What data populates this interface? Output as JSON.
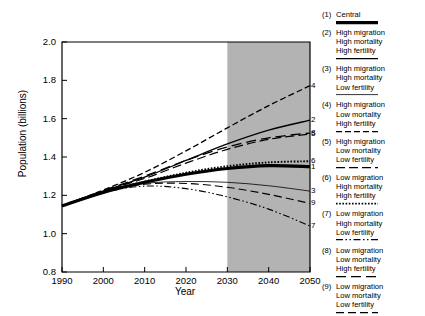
{
  "chart_data": {
    "type": "line",
    "title": "",
    "xlabel": "Year",
    "ylabel": "Population (billions)",
    "xlim": [
      1990,
      2050
    ],
    "ylim": [
      0.8,
      2.0
    ],
    "xticks": [
      1990,
      2000,
      2010,
      2020,
      2030,
      2040,
      2050
    ],
    "yticks": [
      "0.8",
      "1.0",
      "1.2",
      "1.4",
      "1.6",
      "1.8",
      "2.0"
    ],
    "grid": false,
    "legend_position": "right",
    "shaded_region": {
      "from": 2030,
      "to": 2050,
      "color": "#b3b3b3"
    },
    "x": [
      1990,
      2000,
      2010,
      2020,
      2030,
      2040,
      2050
    ],
    "series": [
      {
        "id": "1",
        "name": "Central",
        "style": "thick-solid",
        "end_label": "1",
        "values": [
          1.145,
          1.215,
          1.268,
          1.31,
          1.34,
          1.355,
          1.35
        ]
      },
      {
        "id": "2",
        "name": "High migration High mortality High fertility",
        "style": "solid",
        "end_label": "2",
        "values": [
          1.145,
          1.222,
          1.295,
          1.382,
          1.468,
          1.54,
          1.592
        ]
      },
      {
        "id": "3",
        "name": "High migration High mortality Low fertility",
        "style": "solid-thin",
        "end_label": "3",
        "values": [
          1.145,
          1.22,
          1.262,
          1.272,
          1.268,
          1.25,
          1.222
        ]
      },
      {
        "id": "4",
        "name": "High migration Low mortality High fertility",
        "style": "dashed",
        "end_label": "4",
        "values": [
          1.145,
          1.228,
          1.32,
          1.432,
          1.552,
          1.668,
          1.772
        ]
      },
      {
        "id": "5",
        "name": "High migration Low mortality Low fertility",
        "style": "long-dash",
        "end_label": "5",
        "values": [
          1.145,
          1.222,
          1.288,
          1.368,
          1.44,
          1.492,
          1.52
        ]
      },
      {
        "id": "6",
        "name": "Low migration High mortality High fertility",
        "style": "dotted",
        "end_label": "6",
        "values": [
          1.145,
          1.218,
          1.272,
          1.318,
          1.352,
          1.372,
          1.378
        ]
      },
      {
        "id": "7",
        "name": "Low migration High mortality Low fertility",
        "style": "dash-dot-dot",
        "end_label": "7",
        "values": [
          1.145,
          1.215,
          1.248,
          1.235,
          1.192,
          1.128,
          1.04
        ]
      },
      {
        "id": "8",
        "name": "Low migration Low mortality High fertility",
        "style": "long-dash-wide",
        "end_label": "8",
        "values": [
          1.145,
          1.225,
          1.3,
          1.382,
          1.452,
          1.5,
          1.525
        ]
      },
      {
        "id": "9",
        "name": "Low migration Low mortality Low fertility",
        "style": "long-dash-2",
        "end_label": "9",
        "values": [
          1.145,
          1.218,
          1.258,
          1.262,
          1.242,
          1.205,
          1.158
        ]
      }
    ]
  },
  "axis": {
    "ylabel": "Population (billions)",
    "xlabel": "Year",
    "yticks": [
      "2.0",
      "1.8",
      "1.6",
      "1.4",
      "1.2",
      "1.0",
      "0.8"
    ],
    "xticks": [
      "1990",
      "2000",
      "2010",
      "2020",
      "2030",
      "2040",
      "2050"
    ]
  },
  "end_labels": [
    "4",
    "2",
    "8",
    "6",
    "1",
    "5",
    "3",
    "9",
    "7"
  ],
  "legend": {
    "items": [
      {
        "num": "(1)",
        "lines": [
          "Central"
        ],
        "style": "thick-solid"
      },
      {
        "num": "(2)",
        "lines": [
          "High migration",
          "High mortality",
          "High fertility"
        ],
        "style": "solid"
      },
      {
        "num": "(3)",
        "lines": [
          "High migration",
          "High mortality",
          "Low fertility"
        ],
        "style": "solid-thin"
      },
      {
        "num": "(4)",
        "lines": [
          "High migration",
          "Low mortality",
          "High fertility"
        ],
        "style": "dashed"
      },
      {
        "num": "(5)",
        "lines": [
          "High migration",
          "Low mortality",
          "Low fertility"
        ],
        "style": "long-dash"
      },
      {
        "num": "(6)",
        "lines": [
          "Low migration",
          "High mortality",
          "High fertility"
        ],
        "style": "dotted"
      },
      {
        "num": "(7)",
        "lines": [
          "Low migration",
          "High mortality",
          "Low fertility"
        ],
        "style": "dash-dot-dot"
      },
      {
        "num": "(8)",
        "lines": [
          "Low migration",
          "Low mortality",
          "High fertility"
        ],
        "style": "long-dash-wide"
      },
      {
        "num": "(9)",
        "lines": [
          "Low migration",
          "Low mortality",
          "Low fertility"
        ],
        "style": "long-dash-2"
      }
    ]
  }
}
